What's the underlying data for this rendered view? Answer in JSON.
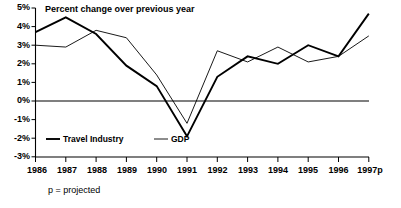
{
  "chart_data": {
    "type": "line",
    "title": "Percent change over previous year",
    "xlabel": "",
    "ylabel": "",
    "ylim": [
      -3,
      5
    ],
    "ytick_step": 1,
    "yticks": [
      "5%",
      "4%",
      "3%",
      "2%",
      "1%",
      "0%",
      "-1%",
      "-2%",
      "-3%"
    ],
    "ytick_values": [
      5,
      4,
      3,
      2,
      1,
      0,
      -1,
      -2,
      -3
    ],
    "grid": false,
    "zero_line": true,
    "legend_position": "inside-bottom-left",
    "categories": [
      "1986",
      "1987",
      "1988",
      "1989",
      "1990",
      "1991",
      "1992",
      "1993",
      "1994",
      "1995",
      "1996",
      "1997p"
    ],
    "x": [
      1986,
      1987,
      1988,
      1989,
      1990,
      1991,
      1992,
      1993,
      1994,
      1995,
      1996,
      1997
    ],
    "series": [
      {
        "name": "Travel Industry",
        "style": "thick",
        "values": [
          3.7,
          4.5,
          3.6,
          1.9,
          0.8,
          -1.9,
          1.3,
          2.4,
          2.0,
          3.0,
          2.4,
          4.7
        ]
      },
      {
        "name": "GDP",
        "style": "thin",
        "values": [
          3.0,
          2.9,
          3.8,
          3.4,
          1.4,
          -1.2,
          2.7,
          2.1,
          2.9,
          2.1,
          2.4,
          3.5
        ]
      }
    ],
    "annotations": [
      {
        "text": "p = projected"
      }
    ]
  },
  "legend": {
    "items": [
      {
        "label": "Travel Industry"
      },
      {
        "label": "GDP"
      }
    ]
  },
  "footnote": {
    "text": "p = projected"
  },
  "colors": {
    "ink": "#000000",
    "background": "#ffffff"
  }
}
